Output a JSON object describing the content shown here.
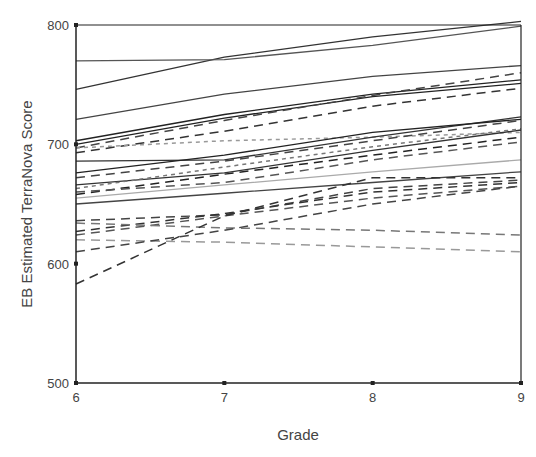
{
  "chart_data": {
    "type": "line",
    "title": "",
    "xlabel": "Grade",
    "ylabel": "EB Estimated TerraNova Score",
    "x": [
      6,
      7,
      8,
      9
    ],
    "xticks": [
      "6",
      "7",
      "8",
      "9"
    ],
    "yticks": [
      "500",
      "600",
      "700",
      "800"
    ],
    "ylim": [
      500,
      800
    ],
    "xlim": [
      6,
      9
    ],
    "grid": false,
    "legend": "none",
    "series": [
      {
        "name": "s1",
        "style": "solid",
        "color": "#333333",
        "values": [
          746,
          773,
          790,
          803
        ]
      },
      {
        "name": "s2",
        "style": "solid",
        "color": "#555555",
        "values": [
          770,
          771,
          783,
          799
        ]
      },
      {
        "name": "s3",
        "style": "solid",
        "color": "#444444",
        "values": [
          721,
          742,
          757,
          766
        ]
      },
      {
        "name": "s4",
        "style": "solid",
        "color": "#222222",
        "values": [
          703,
          725,
          742,
          754
        ]
      },
      {
        "name": "s5",
        "style": "solid",
        "color": "#222222",
        "values": [
          700,
          722,
          740,
          751
        ]
      },
      {
        "name": "s6",
        "style": "dashed",
        "color": "#444444",
        "values": [
          697,
          720,
          741,
          760
        ]
      },
      {
        "name": "s7",
        "style": "dashed",
        "color": "#333333",
        "values": [
          693,
          711,
          732,
          747
        ]
      },
      {
        "name": "s8",
        "style": "dotted",
        "color": "#999999",
        "values": [
          697,
          703,
          706,
          710
        ]
      },
      {
        "name": "s9",
        "style": "solid",
        "color": "#333333",
        "values": [
          686,
          687,
          706,
          723
        ]
      },
      {
        "name": "s10",
        "style": "solid",
        "color": "#222222",
        "values": [
          676,
          691,
          710,
          721
        ]
      },
      {
        "name": "s11",
        "style": "dashed",
        "color": "#444444",
        "values": [
          672,
          686,
          703,
          720
        ]
      },
      {
        "name": "s12",
        "style": "solid",
        "color": "#333333",
        "values": [
          666,
          676,
          695,
          712
        ]
      },
      {
        "name": "s13",
        "style": "dashed",
        "color": "#222222",
        "values": [
          658,
          675,
          691,
          706
        ]
      },
      {
        "name": "s14",
        "style": "dashed",
        "color": "#555555",
        "values": [
          660,
          668,
          687,
          702
        ]
      },
      {
        "name": "s15",
        "style": "dotted",
        "color": "#777777",
        "values": [
          663,
          681,
          698,
          713
        ]
      },
      {
        "name": "s16",
        "style": "solid",
        "color": "#aaaaaa",
        "values": [
          655,
          666,
          677,
          687
        ]
      },
      {
        "name": "s17",
        "style": "solid",
        "color": "#444444",
        "values": [
          650,
          659,
          668,
          677
        ]
      },
      {
        "name": "s18",
        "style": "dashed",
        "color": "#444444",
        "values": [
          636,
          641,
          663,
          670
        ]
      },
      {
        "name": "s19",
        "style": "dashed",
        "color": "#333333",
        "values": [
          627,
          642,
          660,
          668
        ]
      },
      {
        "name": "s20",
        "style": "dashed",
        "color": "#555555",
        "values": [
          624,
          640,
          655,
          665
        ]
      },
      {
        "name": "s21",
        "style": "dashed",
        "color": "#777777",
        "values": [
          634,
          630,
          628,
          624
        ]
      },
      {
        "name": "s22",
        "style": "dashed",
        "color": "#999999",
        "values": [
          620,
          618,
          614,
          610
        ]
      },
      {
        "name": "s23",
        "style": "dashed",
        "color": "#444444",
        "values": [
          610,
          628,
          650,
          665
        ]
      },
      {
        "name": "s24",
        "style": "dashed",
        "color": "#333333",
        "values": [
          583,
          640,
          672,
          672
        ]
      }
    ]
  }
}
